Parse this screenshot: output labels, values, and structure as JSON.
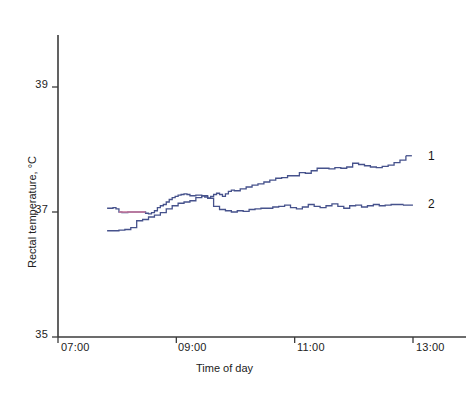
{
  "chart_data": {
    "type": "line",
    "title": "",
    "xlabel": "Time of day",
    "ylabel": "Rectal temperature, °C",
    "xtick_labels": [
      "07:00",
      "09:00",
      "11:00",
      "13:00"
    ],
    "xtick_values": [
      7,
      9,
      11,
      13
    ],
    "ytick_labels": [
      "35",
      "37",
      "39"
    ],
    "ytick_values": [
      35,
      37,
      39
    ],
    "xlim": [
      7,
      13
    ],
    "ylim": [
      35,
      39
    ],
    "grid": false,
    "legend_position": "right-inline",
    "line_color": "#46528c",
    "highlight_color": "#c97a9e",
    "axis_color": "#3b3b3b",
    "series": [
      {
        "name": "1",
        "label": "1",
        "color": "#46528c",
        "end_label_value": 37.9,
        "x": [
          7.83,
          7.88,
          7.93,
          7.98,
          8.03,
          8.08,
          8.13,
          8.18,
          8.23,
          8.28,
          8.33,
          8.38,
          8.43,
          8.48,
          8.53,
          8.58,
          8.63,
          8.68,
          8.73,
          8.78,
          8.83,
          8.88,
          8.93,
          8.98,
          9.03,
          9.08,
          9.13,
          9.18,
          9.23,
          9.28,
          9.33,
          9.38,
          9.43,
          9.48,
          9.53,
          9.58,
          9.63,
          9.68,
          9.73,
          9.78,
          9.83,
          9.88,
          9.93,
          9.98,
          10.08,
          10.18,
          10.28,
          10.38,
          10.48,
          10.58,
          10.68,
          10.78,
          10.88,
          10.98,
          11.08,
          11.18,
          11.28,
          11.38,
          11.48,
          11.58,
          11.68,
          11.78,
          11.88,
          11.98,
          12.08,
          12.18,
          12.28,
          12.38,
          12.48,
          12.58,
          12.68,
          12.78,
          12.88
        ],
        "y": [
          37.06,
          37.06,
          37.07,
          37.05,
          37.0,
          36.99,
          36.99,
          37.0,
          37.0,
          37.0,
          37.0,
          37.0,
          37.0,
          36.98,
          36.97,
          36.99,
          37.02,
          37.07,
          37.1,
          37.12,
          37.16,
          37.2,
          37.23,
          37.25,
          37.27,
          37.28,
          37.29,
          37.28,
          37.26,
          37.26,
          37.27,
          37.27,
          37.26,
          37.24,
          37.22,
          37.25,
          37.28,
          37.3,
          37.28,
          37.25,
          37.29,
          37.33,
          37.35,
          37.34,
          37.37,
          37.4,
          37.43,
          37.45,
          37.48,
          37.51,
          37.54,
          37.55,
          37.58,
          37.58,
          37.63,
          37.62,
          37.66,
          37.7,
          37.7,
          37.69,
          37.71,
          37.7,
          37.72,
          37.78,
          37.76,
          37.74,
          37.72,
          37.71,
          37.73,
          37.75,
          37.79,
          37.83,
          37.9
        ]
      },
      {
        "name": "2",
        "label": "2",
        "color": "#46528c",
        "end_label_value": 37.1,
        "x": [
          7.83,
          7.93,
          8.03,
          8.13,
          8.23,
          8.33,
          8.43,
          8.53,
          8.63,
          8.73,
          8.83,
          8.93,
          9.03,
          9.13,
          9.23,
          9.33,
          9.43,
          9.53,
          9.63,
          9.73,
          9.83,
          9.93,
          10.03,
          10.13,
          10.23,
          10.33,
          10.43,
          10.53,
          10.63,
          10.73,
          10.83,
          10.93,
          11.03,
          11.13,
          11.23,
          11.33,
          11.43,
          11.53,
          11.63,
          11.73,
          11.83,
          11.93,
          12.03,
          12.13,
          12.23,
          12.33,
          12.43,
          12.53,
          12.63,
          12.73,
          12.83
        ],
        "y": [
          36.7,
          36.7,
          36.71,
          36.72,
          36.75,
          36.86,
          36.88,
          36.92,
          36.95,
          36.99,
          37.05,
          37.1,
          37.14,
          37.16,
          37.18,
          37.23,
          37.26,
          37.22,
          37.09,
          37.04,
          37.02,
          37.0,
          37.02,
          37.01,
          37.04,
          37.05,
          37.06,
          37.06,
          37.08,
          37.09,
          37.11,
          37.07,
          37.05,
          37.08,
          37.12,
          37.09,
          37.07,
          37.1,
          37.13,
          37.09,
          37.06,
          37.1,
          37.11,
          37.08,
          37.1,
          37.12,
          37.1,
          37.11,
          37.12,
          37.12,
          37.11
        ]
      }
    ],
    "highlight_segment": {
      "note": "pink/magenta overdrawn segment on series 1 early plateau",
      "color": "#c97a9e",
      "x_start": 8.03,
      "x_end": 8.48,
      "y": 37.0
    }
  },
  "axes": {
    "x_axis_name": "time-axis",
    "y_axis_name": "temperature-axis"
  }
}
